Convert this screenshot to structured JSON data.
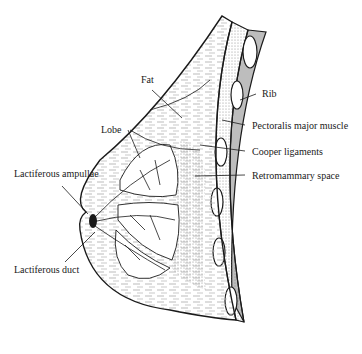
{
  "diagram": {
    "labels": {
      "fat": "Fat",
      "rib": "Rib",
      "pectoralis": "Pectoralis major muscle",
      "lobe": "Lobe",
      "cooper": "Cooper ligaments",
      "ampullae": "Lactiferous ampullae",
      "retromammary": "Retromammary space",
      "duct": "Lactiferous duct"
    },
    "colors": {
      "line": "#1a1a1a",
      "muscle_fill": "#e6e6e6",
      "rib_band_fill": "#bdbdbd",
      "rib_fill": "#ffffff"
    }
  }
}
